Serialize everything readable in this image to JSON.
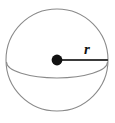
{
  "figure": {
    "type": "geometry-diagram",
    "shape_name": "sphere",
    "canvas": {
      "width": 115,
      "height": 123,
      "background_color": "#ffffff"
    },
    "sphere": {
      "center_x": 57,
      "center_y": 60,
      "radius": 51,
      "outline_color": "#8a8a8a",
      "outline_width": 1.1,
      "fill_color": "#ffffff"
    },
    "equator": {
      "description": "front half of equator ellipse",
      "start_x": 6.5,
      "start_y": 62,
      "end_x": 107.5,
      "end_y": 62,
      "ellipse_rx": 50.5,
      "ellipse_ry": 16,
      "stroke_color": "#8a8a8a",
      "stroke_width": 1.1
    },
    "center_point": {
      "label": "center",
      "x": 57,
      "y": 60,
      "dot_radius": 5.4,
      "color": "#111111"
    },
    "radius_segment": {
      "label": "r",
      "from_x": 57,
      "from_y": 60,
      "to_x": 108,
      "to_y": 60,
      "stroke_color": "#3b3b3b",
      "stroke_width": 2.1
    },
    "radius_label": {
      "text": "r",
      "x": 84,
      "y": 54,
      "color": "#111111",
      "style": "italic-serif-bold"
    }
  }
}
